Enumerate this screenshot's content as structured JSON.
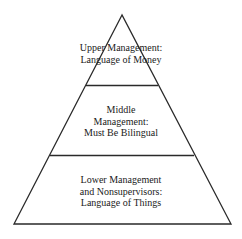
{
  "diagram": {
    "type": "pyramid",
    "line_color": "#2a2a2a",
    "tiers": [
      {
        "name": "upper",
        "lines": [
          "Upper Management:",
          "Language of Money"
        ]
      },
      {
        "name": "middle",
        "lines": [
          "Middle",
          "Management:",
          "Must Be Bilingual"
        ]
      },
      {
        "name": "lower",
        "lines": [
          "Lower Management",
          "and Nonsupervisors:",
          "Language of Things"
        ]
      }
    ]
  }
}
